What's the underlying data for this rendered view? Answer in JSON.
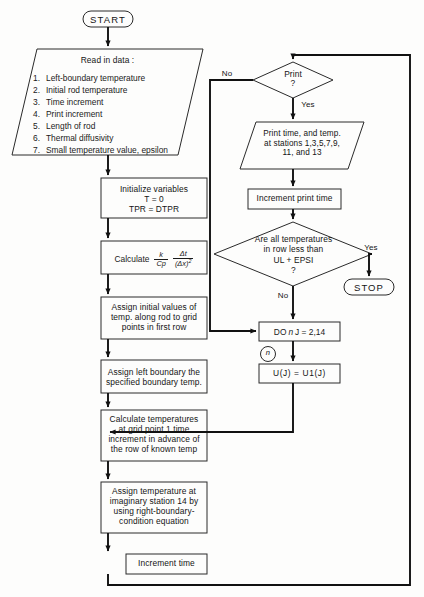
{
  "terminals": {
    "start": "START",
    "stop": "STOP"
  },
  "read_data": {
    "header": "Read in data :",
    "items": [
      {
        "num": "1.",
        "text": "Left-boundary temperature"
      },
      {
        "num": "2.",
        "text": "Initial rod temperature"
      },
      {
        "num": "3.",
        "text": "Time increment"
      },
      {
        "num": "4.",
        "text": "Print increment"
      },
      {
        "num": "5.",
        "text": "Length of rod"
      },
      {
        "num": "6.",
        "text": "Thermal diffusivity"
      },
      {
        "num": "7.",
        "text": "Small temperature value, epsilon"
      }
    ]
  },
  "process": {
    "initialize": "Initialize variables\nT = 0\nTPR = DTPR",
    "calculate_word": "Calculate",
    "calculate_frac1_num": "k",
    "calculate_frac1_den": "Cp",
    "calculate_frac2_num": "Δt",
    "calculate_frac2_den": "(Δx)",
    "calculate_frac2_den_exp": "2",
    "assign_initial": "Assign initial values of\ntemp. along rod to grid\npoints in first row",
    "assign_left": "Assign left boundary the\nspecified boundary temp.",
    "calc_temps": "Calculate temperatures\nat grid point 1 time\nincrement in advance of\nthe row of known temp",
    "assign_imaginary": "Assign temperature at\nimaginary station 14 by\nusing right-boundary-\ncondition equation",
    "increment_time": "Increment time"
  },
  "right_branch": {
    "print_decision": "Print\n?",
    "print_no": "No",
    "print_yes": "Yes",
    "print_output": "Print time, and temp.\nat stations 1,3,5,7,9,\n11, and 13",
    "increment_print_time": "Increment print time",
    "temp_decision": "Are all temperatures\nin row less than\nUL + EPSI\n?",
    "temp_yes": "Yes",
    "temp_no": "No",
    "do_loop_prefix": "DO",
    "do_loop_n": "n",
    "do_loop_range": "J = 2,14",
    "connector_n": "n",
    "assign_u": "U(J) = U1(J)"
  },
  "colors": {
    "stroke": "#2a2a2a",
    "connector": "#111111",
    "background": "#fdfdfc",
    "text": "#141414"
  }
}
